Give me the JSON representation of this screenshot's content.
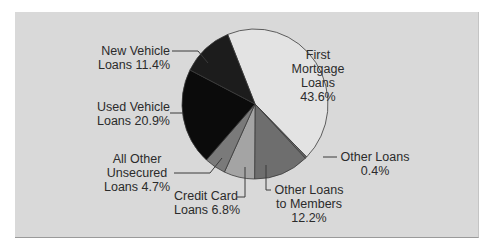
{
  "chart_data": {
    "type": "pie",
    "title": "",
    "start_angle_deg": -22,
    "direction": "clockwise",
    "slices": [
      {
        "label": "First Mortgage Loans",
        "value": 43.6,
        "color": "#e3e3e3"
      },
      {
        "label": "Other Loans",
        "value": 0.4,
        "color": "#6a6a6a"
      },
      {
        "label": "Other Loans to Members",
        "value": 12.2,
        "color": "#6e6e6e"
      },
      {
        "label": "Credit Card Loans",
        "value": 6.8,
        "color": "#a4a4a4"
      },
      {
        "label": "All Other Unsecured Loans",
        "value": 4.7,
        "color": "#7a7a7a"
      },
      {
        "label": "Used Vehicle Loans",
        "value": 20.9,
        "color": "#0b0b0b"
      },
      {
        "label": "New Vehicle Loans",
        "value": 11.4,
        "color": "#1c1c1c"
      }
    ],
    "categories": [
      "First Mortgage Loans",
      "Other Loans",
      "Other Loans to Members",
      "Credit Card Loans",
      "All Other Unsecured Loans",
      "Used Vehicle Loans",
      "New Vehicle Loans"
    ],
    "values": [
      43.6,
      0.4,
      12.2,
      6.8,
      4.7,
      20.9,
      11.4
    ],
    "unit": "%",
    "legend": "none (direct labels with leader lines)"
  },
  "labels": {
    "first_mortgage": {
      "l1": "First",
      "l2": "Mortgage",
      "l3": "Loans",
      "l4": "43.6%"
    },
    "new_vehicle": {
      "l1": "New Vehicle",
      "l2": "Loans 11.4%"
    },
    "used_vehicle": {
      "l1": "Used Vehicle",
      "l2": "Loans 20.9%"
    },
    "all_other_unsecured": {
      "l1": "All Other",
      "l2": "Unsecured",
      "l3": "Loans 4.7%"
    },
    "credit_card": {
      "l1": "Credit Card",
      "l2": "Loans 6.8%"
    },
    "other_loans_members": {
      "l1": "Other Loans",
      "l2": "to Members",
      "l3": "12.2%"
    },
    "other_loans": {
      "l1": "Other Loans",
      "l2": "0.4%"
    }
  },
  "colors": {
    "panel_bg": "#d9d9d9",
    "outline": "#3a3a3a",
    "leader": "#3a3a3a"
  }
}
